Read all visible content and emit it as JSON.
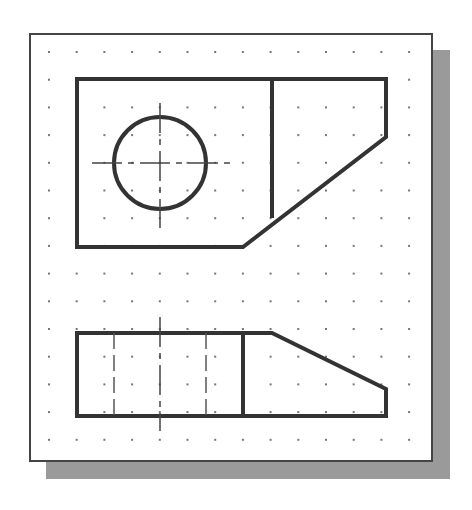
{
  "drawing": {
    "title": "Orthographic projection - top view and front view",
    "colors": {
      "background": "#ffffff",
      "sheet": "#ffffff",
      "sheet_border": "#444444",
      "shadow": "#9a9a9a",
      "object_line": "#333333",
      "hidden_line": "#555555",
      "center_line": "#444444",
      "grid_dot": "#777777"
    },
    "sheet": {
      "left": 29,
      "top": 33,
      "right": 432,
      "bottom": 461
    },
    "shadow": {
      "offset_x": 17,
      "offset_y": 17
    },
    "grid": {
      "x_start": 49,
      "y_start": 52,
      "spacing": 27.7,
      "cols": 14,
      "rows": 15
    },
    "top_view": {
      "outline": [
        [
          77,
          79
        ],
        [
          386,
          79
        ],
        [
          386,
          137
        ],
        [
          243,
          247
        ],
        [
          77,
          247
        ]
      ],
      "divider": [
        [
          272,
          79
        ],
        [
          272,
          218
        ]
      ],
      "hole": {
        "cx": 160,
        "cy": 163,
        "r": 46
      },
      "center_h": [
        [
          92,
          163
        ],
        [
          234,
          163
        ]
      ],
      "center_v": [
        [
          160,
          103
        ],
        [
          160,
          228
        ]
      ]
    },
    "front_view": {
      "outline": [
        [
          77,
          333
        ],
        [
          272,
          333
        ],
        [
          386,
          389
        ],
        [
          386,
          416
        ],
        [
          77,
          416
        ]
      ],
      "divider": [
        [
          243,
          333
        ],
        [
          243,
          416
        ]
      ],
      "hidden_lines": [
        [
          [
            114,
            333
          ],
          [
            114,
            416
          ]
        ],
        [
          [
            206,
            333
          ],
          [
            206,
            416
          ]
        ]
      ],
      "center_v": [
        [
          160,
          317
        ],
        [
          160,
          431
        ]
      ]
    }
  }
}
